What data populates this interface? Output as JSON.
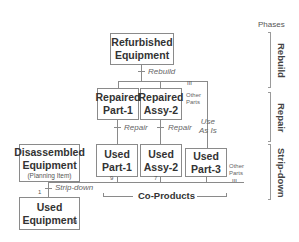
{
  "nodes": {
    "refurbished": {
      "line1": "Refurbished",
      "line2": "Equipment"
    },
    "repaired_part1": {
      "line1": "Repaired",
      "line2": "Part-1"
    },
    "repaired_assy2": {
      "line1": "Repaired",
      "line2": "Assy-2"
    },
    "used_part1": {
      "line1": "Used",
      "line2": "Part-1"
    },
    "used_assy2": {
      "line1": "Used",
      "line2": "Assy-2"
    },
    "used_part3": {
      "line1": "Used",
      "line2": "Part-3"
    },
    "disassembled": {
      "line1": "Disassembled",
      "line2": "Equipment",
      "note": "(Planning Item)"
    },
    "used_equipment": {
      "line1": "Used",
      "line2": "Equipment",
      "corner": "6a"
    }
  },
  "edges": {
    "rebuild": "Rebuild",
    "repair1": "Repair",
    "repair2": "Repair",
    "use_as_is_1": "Use",
    "use_as_is_2": "As Is",
    "strip_down": "Strip-down",
    "other_parts_top_1": "Other",
    "other_parts_top_2": "Parts",
    "other_parts_bottom_1": "Other",
    "other_parts_bottom_2": "Parts",
    "qty_1": "1",
    "qty_9": "9",
    "qty_7": "7"
  },
  "co_products": "Co-Products",
  "phases": {
    "title": "Phases",
    "items": [
      "Rebuild",
      "Repair",
      "Strip-down"
    ]
  }
}
